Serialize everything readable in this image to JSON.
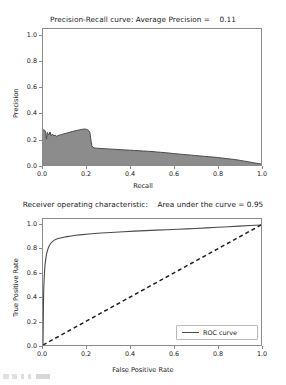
{
  "figures": {
    "precision_recall": {
      "title": "Precision-Recall curve: Average Precision =    0.11",
      "xlabel": "Recall",
      "ylabel": "Precision",
      "xticks": [
        "0.0",
        "0.2",
        "0.4",
        "0.6",
        "0.8",
        "1.0"
      ],
      "yticks": [
        "0.0",
        "0.2",
        "0.4",
        "0.6",
        "0.8",
        "1.0"
      ]
    },
    "roc": {
      "title": "Receiver operating characteristic:    Area under the curve = 0.95",
      "xlabel": "False Positive Rate",
      "ylabel": "True Positive Rate",
      "xticks": [
        "0.0",
        "0.2",
        "0.4",
        "0.6",
        "0.8",
        "1.0"
      ],
      "yticks": [
        "0.0",
        "0.2",
        "0.4",
        "0.6",
        "0.8",
        "1.0"
      ],
      "legend_label": "ROC curve"
    }
  },
  "colors": {
    "curve": "#4a4a4a",
    "fill": "#8c8c8c",
    "axis": "#8a8a8a",
    "text": "#1a1a1a",
    "background": "#ffffff"
  },
  "chart_data": [
    {
      "type": "area",
      "title": "Precision-Recall curve: Average Precision =    0.11",
      "xlabel": "Recall",
      "ylabel": "Precision",
      "xlim": [
        0.0,
        1.0
      ],
      "ylim": [
        0.0,
        1.05
      ],
      "grid": false,
      "legend": null,
      "average_precision": 0.11,
      "series": [
        {
          "name": "Precision-Recall",
          "x": [
            0.0,
            0.004,
            0.008,
            0.012,
            0.016,
            0.02,
            0.024,
            0.028,
            0.032,
            0.038,
            0.044,
            0.05,
            0.056,
            0.062,
            0.07,
            0.078,
            0.086,
            0.094,
            0.102,
            0.11,
            0.118,
            0.126,
            0.134,
            0.142,
            0.15,
            0.158,
            0.166,
            0.174,
            0.182,
            0.19,
            0.198,
            0.205,
            0.21,
            0.215,
            0.218,
            0.221,
            0.224,
            0.228,
            0.235,
            0.245,
            0.26,
            0.28,
            0.3,
            0.32,
            0.34,
            0.36,
            0.38,
            0.4,
            0.42,
            0.44,
            0.46,
            0.48,
            0.5,
            0.52,
            0.54,
            0.56,
            0.58,
            0.6,
            0.62,
            0.64,
            0.66,
            0.68,
            0.7,
            0.72,
            0.74,
            0.76,
            0.78,
            0.8,
            0.82,
            0.84,
            0.86,
            0.88,
            0.9,
            0.92,
            0.94,
            0.96,
            0.98,
            1.0
          ],
          "y": [
            0.27,
            0.272,
            0.268,
            0.255,
            0.2,
            0.252,
            0.24,
            0.232,
            0.255,
            0.226,
            0.238,
            0.224,
            0.23,
            0.222,
            0.228,
            0.232,
            0.236,
            0.24,
            0.243,
            0.247,
            0.251,
            0.255,
            0.258,
            0.262,
            0.265,
            0.268,
            0.271,
            0.274,
            0.276,
            0.278,
            0.276,
            0.272,
            0.266,
            0.25,
            0.215,
            0.18,
            0.15,
            0.136,
            0.132,
            0.13,
            0.128,
            0.126,
            0.124,
            0.122,
            0.12,
            0.118,
            0.116,
            0.114,
            0.112,
            0.11,
            0.108,
            0.106,
            0.104,
            0.101,
            0.098,
            0.095,
            0.092,
            0.088,
            0.085,
            0.082,
            0.079,
            0.076,
            0.073,
            0.07,
            0.067,
            0.064,
            0.061,
            0.058,
            0.054,
            0.05,
            0.046,
            0.042,
            0.037,
            0.031,
            0.025,
            0.019,
            0.013,
            0.008
          ]
        }
      ]
    },
    {
      "type": "line",
      "title": "Receiver operating characteristic:    Area under the curve = 0.95",
      "xlabel": "False Positive Rate",
      "ylabel": "True Positive Rate",
      "xlim": [
        0.0,
        1.0
      ],
      "ylim": [
        0.0,
        1.05
      ],
      "grid": false,
      "legend": [
        "ROC curve"
      ],
      "legend_position": "lower right",
      "auc": 0.95,
      "series": [
        {
          "name": "ROC curve",
          "style": "solid",
          "x": [
            0.0,
            0.001,
            0.002,
            0.003,
            0.004,
            0.006,
            0.008,
            0.01,
            0.013,
            0.016,
            0.02,
            0.025,
            0.03,
            0.036,
            0.042,
            0.05,
            0.06,
            0.07,
            0.08,
            0.095,
            0.11,
            0.13,
            0.15,
            0.18,
            0.21,
            0.25,
            0.29,
            0.33,
            0.37,
            0.42,
            0.47,
            0.52,
            0.57,
            0.62,
            0.66,
            0.7,
            0.75,
            0.8,
            0.85,
            0.9,
            0.95,
            1.0
          ],
          "y": [
            0.0,
            0.18,
            0.33,
            0.43,
            0.5,
            0.58,
            0.64,
            0.68,
            0.72,
            0.755,
            0.785,
            0.812,
            0.832,
            0.848,
            0.86,
            0.872,
            0.881,
            0.887,
            0.892,
            0.898,
            0.903,
            0.909,
            0.914,
            0.92,
            0.925,
            0.931,
            0.936,
            0.94,
            0.944,
            0.949,
            0.953,
            0.957,
            0.961,
            0.965,
            0.968,
            0.971,
            0.976,
            0.981,
            0.986,
            0.991,
            0.996,
            1.0
          ]
        },
        {
          "name": "chance-diagonal",
          "style": "dashed",
          "x": [
            0.0,
            1.0
          ],
          "y": [
            0.0,
            1.0
          ]
        }
      ]
    }
  ]
}
